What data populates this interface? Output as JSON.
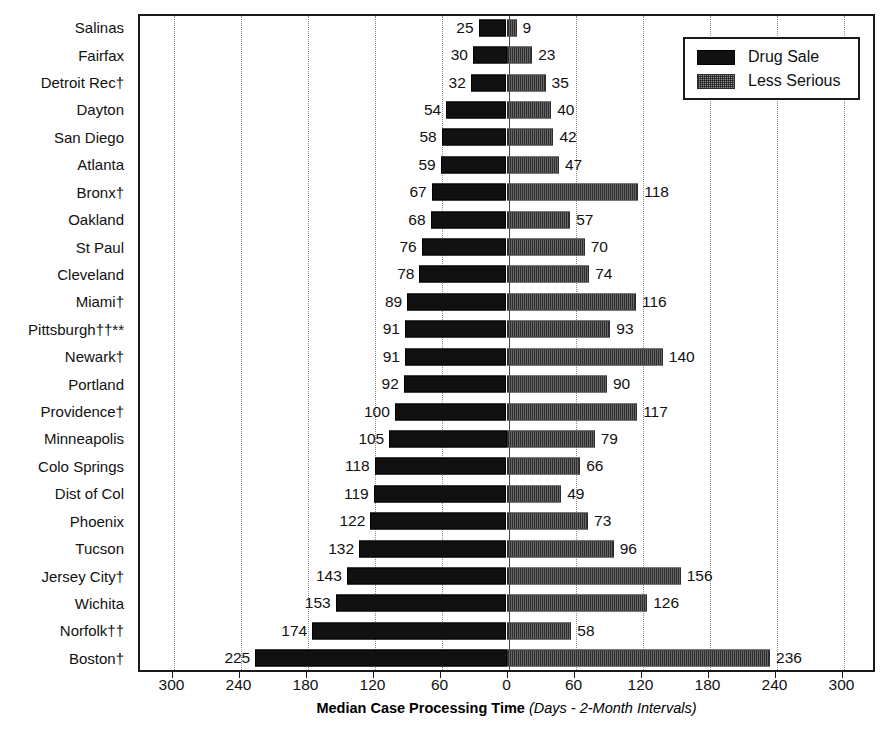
{
  "chart_data": {
    "type": "bar",
    "orientation": "horizontal-diverging",
    "title": "",
    "xlabel_main": "Median Case Processing Time",
    "xlabel_sub": "(Days - 2-Month Intervals)",
    "ylabel": "",
    "grid": true,
    "legend_position": "top-right",
    "xlim": [
      -330,
      330
    ],
    "xticks": [
      -300,
      -240,
      -180,
      -120,
      -60,
      0,
      60,
      120,
      180,
      240,
      300
    ],
    "xtick_labels": [
      "300",
      "240",
      "180",
      "120",
      "60",
      "0",
      "60",
      "120",
      "180",
      "240",
      "300"
    ],
    "categories": [
      "Salinas",
      "Fairfax",
      "Detroit Rec†",
      "Dayton",
      "San Diego",
      "Atlanta",
      "Bronx†",
      "Oakland",
      "St Paul",
      "Cleveland",
      "Miami†",
      "Pittsburgh††**",
      "Newark†",
      "Portland",
      "Providence†",
      "Minneapolis",
      "Colo Springs",
      "Dist of Col",
      "Phoenix",
      "Tucson",
      "Jersey City†",
      "Wichita",
      "Norfolk††",
      "Boston†"
    ],
    "series": [
      {
        "name": "Drug Sale",
        "direction": "left",
        "color": "#111111",
        "values": [
          25,
          30,
          32,
          54,
          58,
          59,
          67,
          68,
          76,
          78,
          89,
          91,
          91,
          92,
          100,
          105,
          118,
          119,
          122,
          132,
          143,
          153,
          174,
          225
        ]
      },
      {
        "name": "Less Serious",
        "direction": "right",
        "color": "#8c8c8c",
        "values": [
          9,
          23,
          35,
          40,
          42,
          47,
          118,
          57,
          70,
          74,
          116,
          93,
          140,
          90,
          117,
          79,
          66,
          49,
          73,
          96,
          156,
          126,
          58,
          236
        ]
      }
    ]
  },
  "legend": {
    "items": [
      {
        "label": "Drug Sale",
        "swatch": "solid-black-swatch"
      },
      {
        "label": "Less Serious",
        "swatch": "stippled-gray-swatch"
      }
    ]
  }
}
